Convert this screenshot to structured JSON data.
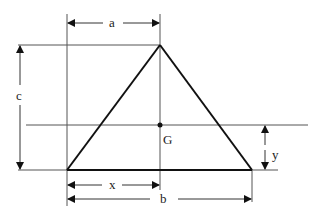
{
  "diagram": {
    "labels": {
      "a": "a",
      "b": "b",
      "c": "c",
      "x": "x",
      "y": "y",
      "G": "G"
    },
    "colors": {
      "line": "#222222",
      "thin": "#555555",
      "background": "#ffffff"
    }
  }
}
